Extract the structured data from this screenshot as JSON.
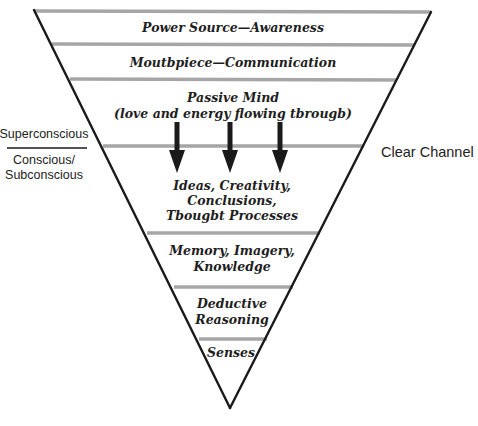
{
  "diagram": {
    "type": "inverted-triangle-layers",
    "colors": {
      "outline": "#1a1a1a",
      "divider": "#a6a6a6",
      "arrow": "#1a1a1a",
      "text": "#1e1e1e"
    },
    "layers": [
      {
        "lines": [
          "Power Source—Awareness"
        ]
      },
      {
        "lines": [
          "Moutbpiece—Communication"
        ]
      },
      {
        "lines": [
          "Passive Mind",
          "(love and energy flowing tbrougb)"
        ]
      },
      {
        "lines": [
          "Ideas, Creativity,",
          "Conclusions,",
          "Tbougbt Processes"
        ]
      },
      {
        "lines": [
          "Memory, Imagery,",
          "Knowledge"
        ]
      },
      {
        "lines": [
          "Deductive",
          "Reasoning"
        ]
      },
      {
        "lines": [
          "Senses"
        ]
      }
    ],
    "arrows": {
      "count": 3,
      "direction": "down",
      "icon": "down-arrow-icon"
    },
    "left_labels": {
      "upper": "Superconscious",
      "lower_line1": "Conscious/",
      "lower_line2": "Subconscious"
    },
    "right_label": "Clear Channel"
  }
}
